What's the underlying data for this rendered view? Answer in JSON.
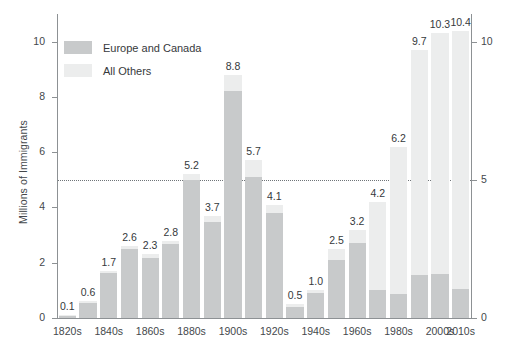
{
  "chart_data": {
    "type": "bar",
    "subtype": "stacked-bar",
    "title": "",
    "xlabel": "",
    "ylabel": "Millions of Immigrants",
    "ylim": [
      0,
      11
    ],
    "yticks": [
      0,
      2,
      4,
      6,
      8,
      10
    ],
    "ytick_labels": [
      "0",
      "2",
      "4",
      "6",
      "8",
      "10"
    ],
    "right_axis": {
      "ticks": [
        0,
        5,
        10
      ],
      "tick_labels": [
        "0",
        "5",
        "10"
      ]
    },
    "grid": false,
    "reference_line": {
      "value": 5,
      "style": "dotted"
    },
    "legend_position": "top-left",
    "categories": [
      "1820s",
      "1830s",
      "1840s",
      "1850s",
      "1860s",
      "1870s",
      "1880s",
      "1890s",
      "1900s",
      "1910s",
      "1920s",
      "1930s",
      "1940s",
      "1950s",
      "1960s",
      "1970s",
      "1980s",
      "1990s",
      "2000s",
      "2010s"
    ],
    "xtick_labels": [
      "1820s",
      "",
      "1840s",
      "",
      "1860s",
      "",
      "1880s",
      "",
      "1900s",
      "",
      "1920s",
      "",
      "1940s",
      "",
      "1960s",
      "",
      "1980s",
      "",
      "2000s",
      "2010s"
    ],
    "totals": [
      0.1,
      0.6,
      1.7,
      2.6,
      2.3,
      2.8,
      5.2,
      3.7,
      8.8,
      5.7,
      4.1,
      0.5,
      1.0,
      2.5,
      3.2,
      4.2,
      6.2,
      9.7,
      10.3,
      10.4
    ],
    "total_labels": [
      "0.1",
      "0.6",
      "1.7",
      "2.6",
      "2.3",
      "2.8",
      "5.2",
      "3.7",
      "8.8",
      "5.7",
      "4.1",
      "0.5",
      "1.0",
      "2.5",
      "3.2",
      "4.2",
      "6.2",
      "9.7",
      "10.3",
      "10.4"
    ],
    "series": [
      {
        "name": "Europe and Canada",
        "color": "#c8cacb",
        "values": [
          0.09,
          0.55,
          1.62,
          2.49,
          2.18,
          2.67,
          5.0,
          3.47,
          8.2,
          5.1,
          3.8,
          0.4,
          0.9,
          2.1,
          2.7,
          1.0,
          0.85,
          1.55,
          1.6,
          1.05
        ]
      },
      {
        "name": "All Others",
        "color": "#eceded",
        "values": [
          0.01,
          0.05,
          0.08,
          0.11,
          0.12,
          0.13,
          0.2,
          0.23,
          0.6,
          0.6,
          0.3,
          0.1,
          0.1,
          0.4,
          0.5,
          3.2,
          5.35,
          8.15,
          8.7,
          9.35
        ]
      }
    ]
  },
  "legend": {
    "items": [
      {
        "label": "Europe and Canada",
        "swatch": "europe"
      },
      {
        "label": "All Others",
        "swatch": "others"
      }
    ]
  },
  "axis": {
    "y_title": "Millions of Immigrants"
  },
  "colors": {
    "europe_and_canada": "#c8cacb",
    "all_others": "#eceded",
    "axis": "#8d9194",
    "text": "#44484b",
    "background": "#ffffff"
  }
}
